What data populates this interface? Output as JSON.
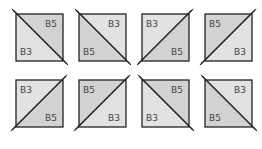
{
  "colors": {
    "b3_fill": "#e2e2e2",
    "b5_fill": "#d2d2d2",
    "stroke": "#222222"
  },
  "tiles": [
    {
      "row": 0,
      "col": 0,
      "diagonal": "tl-br",
      "labels": {
        "upper": "B5",
        "lower": "B3"
      }
    },
    {
      "row": 0,
      "col": 1,
      "diagonal": "tl-br",
      "labels": {
        "upper": "B3",
        "lower": "B5"
      }
    },
    {
      "row": 0,
      "col": 2,
      "diagonal": "bl-tr",
      "labels": {
        "upper": "B3",
        "lower": "B5"
      }
    },
    {
      "row": 0,
      "col": 3,
      "diagonal": "bl-tr",
      "labels": {
        "upper": "B5",
        "lower": "B3"
      }
    },
    {
      "row": 1,
      "col": 0,
      "diagonal": "bl-tr",
      "labels": {
        "upper": "B3",
        "lower": "B5"
      }
    },
    {
      "row": 1,
      "col": 1,
      "diagonal": "bl-tr",
      "labels": {
        "upper": "B5",
        "lower": "B3"
      }
    },
    {
      "row": 1,
      "col": 2,
      "diagonal": "tl-br",
      "labels": {
        "upper": "B5",
        "lower": "B3"
      }
    },
    {
      "row": 1,
      "col": 3,
      "diagonal": "tl-br",
      "labels": {
        "upper": "B3",
        "lower": "B5"
      }
    }
  ]
}
